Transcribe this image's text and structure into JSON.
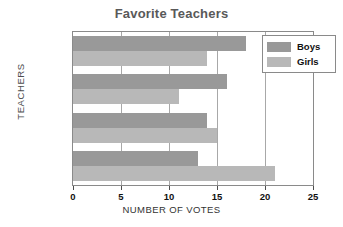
{
  "chart_data": {
    "type": "bar",
    "orientation": "horizontal",
    "title": "Favorite Teachers",
    "xlabel": "NUMBER OF VOTES",
    "ylabel": "TEACHERS",
    "categories": [
      "Nichols",
      "Davis",
      "Tallchief",
      "Torres"
    ],
    "series": [
      {
        "name": "Boys",
        "color": "#999999",
        "values": [
          18,
          16,
          14,
          13
        ]
      },
      {
        "name": "Girls",
        "color": "#b8b8b8",
        "values": [
          14,
          11,
          15,
          21
        ]
      }
    ],
    "xlim": [
      0,
      25
    ],
    "xticks": [
      0,
      5,
      10,
      15,
      20,
      25
    ],
    "xtick_labels": [
      "0",
      "5",
      "10",
      "15",
      "20",
      "25"
    ],
    "grid": true,
    "grid_axis": "x",
    "legend_position": "top-right-inside",
    "title_color": "#595959"
  }
}
